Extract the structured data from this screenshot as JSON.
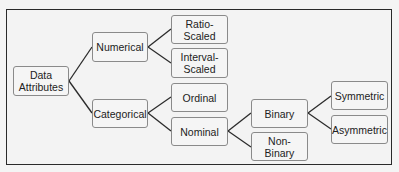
{
  "diagram": {
    "type": "tree",
    "root": "Data Attributes",
    "nodes": {
      "data_attributes": "Data Attributes",
      "numerical": "Numerical",
      "categorical": "Categorical",
      "ratio_scaled": "Ratio-Scaled",
      "interval_scaled": "Interval-Scaled",
      "ordinal": "Ordinal",
      "nominal": "Nominal",
      "binary": "Binary",
      "non_binary": "Non-Binary",
      "symmetric": "Symmetric",
      "asymmetric": "Asymmetric"
    },
    "node_labels_display": {
      "data_attributes_line1": "Data",
      "data_attributes_line2": "Attributes",
      "interval_scaled_line1": "Interval-",
      "interval_scaled_line2": "Scaled"
    },
    "edges": [
      [
        "Data Attributes",
        "Numerical"
      ],
      [
        "Data Attributes",
        "Categorical"
      ],
      [
        "Numerical",
        "Ratio-Scaled"
      ],
      [
        "Numerical",
        "Interval-Scaled"
      ],
      [
        "Categorical",
        "Ordinal"
      ],
      [
        "Categorical",
        "Nominal"
      ],
      [
        "Nominal",
        "Binary"
      ],
      [
        "Nominal",
        "Non-Binary"
      ],
      [
        "Binary",
        "Symmetric"
      ],
      [
        "Binary",
        "Asymmetric"
      ]
    ],
    "colors": {
      "frame_border": "#2a2a2a",
      "node_border": "#8a8a8a",
      "node_fill": "#f5f5f5",
      "edge": "#2a2a2a",
      "text": "#222222"
    }
  }
}
